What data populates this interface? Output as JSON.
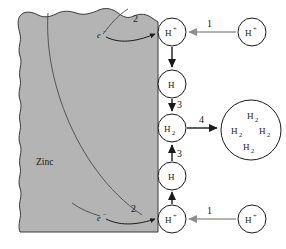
{
  "figure": {
    "type": "process-diagram",
    "background_color": "#ffffff"
  },
  "material": {
    "label": "Zinc",
    "fill_color": "#b4b4b4",
    "edge_color": "#3a3a3a",
    "description": "Gray metal block occupying the left portion, with wavy top and left edges and a straight vertical right surface"
  },
  "steps": [
    {
      "id": "step-1-top",
      "label": "1",
      "meaning": "H+ ion transported from solution to the metal surface"
    },
    {
      "id": "step-2-top",
      "label": "2",
      "meaning": "Electron from the metal combines with adsorbed H+"
    },
    {
      "id": "step-3-top",
      "label": "3",
      "meaning": "Two adsorbed H atoms combine to form H2"
    },
    {
      "id": "step-4",
      "label": "4",
      "meaning": "H2 molecules collect into a gas bubble / blister"
    },
    {
      "id": "step-3-bottom",
      "label": "3",
      "meaning": "Two adsorbed H atoms combine to form H2"
    },
    {
      "id": "step-2-bottom",
      "label": "2",
      "meaning": "Electron from the metal combines with adsorbed H+"
    },
    {
      "id": "step-1-bottom",
      "label": "1",
      "meaning": "H+ ion transported from solution to the metal surface"
    }
  ],
  "nodes": [
    {
      "id": "surface-h-plus-top",
      "species": "H",
      "superscript": "+",
      "subscript": "",
      "x": 172,
      "y": 32,
      "r": 14
    },
    {
      "id": "adsorbed-h-top",
      "species": "H",
      "superscript": "",
      "subscript": "",
      "x": 172,
      "y": 84,
      "r": 14
    },
    {
      "id": "h2-molecule",
      "species": "H",
      "superscript": "",
      "subscript": "2",
      "x": 172,
      "y": 128,
      "r": 14
    },
    {
      "id": "adsorbed-h-bottom",
      "species": "H",
      "superscript": "",
      "subscript": "",
      "x": 172,
      "y": 176,
      "r": 14
    },
    {
      "id": "surface-h-plus-bottom",
      "species": "H",
      "superscript": "+",
      "subscript": "",
      "x": 172,
      "y": 219,
      "r": 14
    },
    {
      "id": "solution-h-plus-top",
      "species": "H",
      "superscript": "+",
      "subscript": "",
      "x": 252,
      "y": 32,
      "r": 14
    },
    {
      "id": "solution-h-plus-bottom",
      "species": "H",
      "superscript": "+",
      "subscript": "",
      "x": 252,
      "y": 219,
      "r": 14
    }
  ],
  "bubble": {
    "id": "hydrogen-gas-bubble",
    "cx": 251,
    "cy": 130,
    "r": 30,
    "contents": [
      {
        "species": "H",
        "subscript": "2",
        "dx": 0,
        "dy": -14
      },
      {
        "species": "H",
        "subscript": "2",
        "dx": -16,
        "dy": 2
      },
      {
        "species": "H",
        "subscript": "2",
        "dx": 15,
        "dy": 2
      },
      {
        "species": "H",
        "subscript": "2",
        "dx": -2,
        "dy": 18
      }
    ]
  },
  "electrons": [
    {
      "id": "electron-top",
      "label": "e",
      "superscript": "−",
      "x": 101,
      "y": 36
    },
    {
      "id": "electron-bottom",
      "label": "e",
      "superscript": "−",
      "x": 101,
      "y": 218
    }
  ],
  "colors": {
    "arrow_dark": "#1a1a1a",
    "arrow_gray": "#9a9a9a",
    "node_fill": "#ffffff",
    "text": "#1a1a1a"
  }
}
